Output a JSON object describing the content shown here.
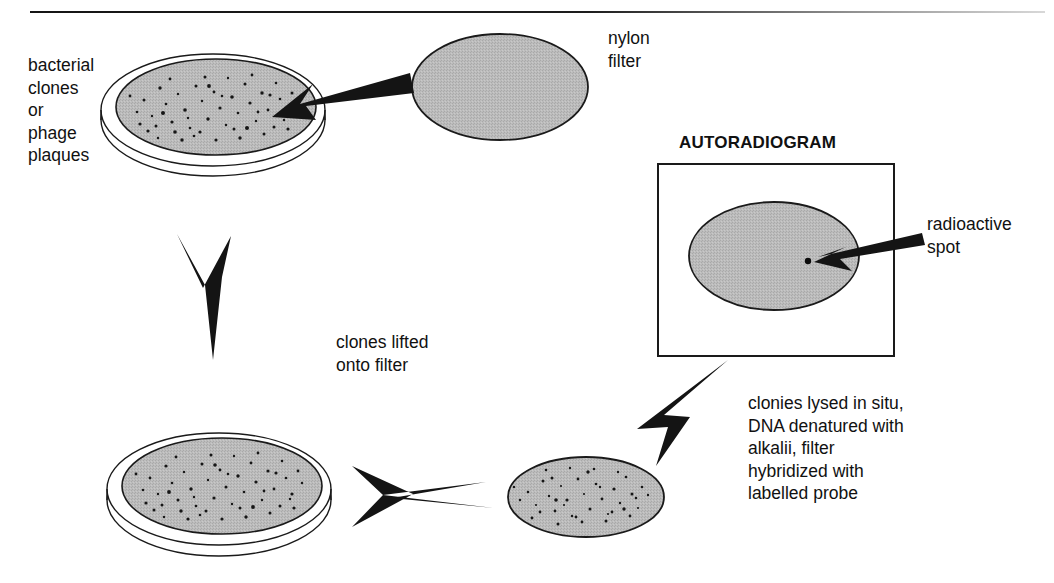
{
  "figure": {
    "title_visible": "AUTORADIOGRAM",
    "background": "#ffffff",
    "rule_color": "#161616",
    "gel_gray": "#b8b8b8",
    "outline_color": "#1a1a1a",
    "arrow_color": "#141414",
    "speckle_color": "#161616"
  },
  "labels": {
    "source_plate": "bacterial\nclones\nor\nphage\nplaques",
    "nylon_filter": "nylon\nfilter",
    "lift_step": "clones lifted\nonto filter",
    "autoradiogram_heading": "AUTORADIOGRAM",
    "radioactive_spot": "radioactive\nspot",
    "hybridization_step": "clonies lysed in situ,\nDNA denatured with\nalkalii, filter\nhybridized with\nlabelled probe"
  },
  "elements": {
    "source_petri_dish": "petri-dish-with-colonies",
    "nylon_filter_disc": "blank-nylon-filter-ellipse",
    "lifted_petri_dish": "petri-dish-after-lift",
    "lifted_filter_disc": "filter-with-transferred-colonies",
    "autoradiogram_film": "autoradiogram-film-box",
    "film_disc": "film-filter-image-ellipse",
    "hot_spot": "single-radioactive-dot"
  },
  "arrows": [
    {
      "name": "arrow-filter-to-plate",
      "direction": "left-down",
      "meaning": "nylon filter applied to plate"
    },
    {
      "name": "arrow-plate-to-plate",
      "direction": "down",
      "meaning": "clones lifted onto filter"
    },
    {
      "name": "arrow-plate-to-filter",
      "direction": "right",
      "meaning": "filter peeled off"
    },
    {
      "name": "arrow-filter-to-film",
      "direction": "up-right",
      "meaning": "hybridize then expose film"
    },
    {
      "name": "arrow-pointer-to-spot",
      "direction": "left",
      "meaning": "points at radioactive spot"
    }
  ]
}
